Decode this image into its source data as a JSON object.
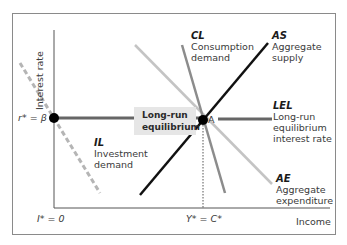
{
  "axes": {
    "y_label": "Interest rate",
    "x_label": "Income",
    "y_tick": "r* = β",
    "x_tick_left": "I* = 0",
    "x_tick_eq": "Y* = C*"
  },
  "points": {
    "beta": "β",
    "A": "A"
  },
  "callout": {
    "line1": "Long-run",
    "line2": "equilibrium"
  },
  "curves": [
    {
      "abbr": "CL",
      "line1": "Consumption",
      "line2": "demand",
      "line3": "",
      "color": "#8c8c8c",
      "style": "solid"
    },
    {
      "abbr": "AS",
      "line1": "Aggregate",
      "line2": "supply",
      "line3": "",
      "color": "#111111",
      "style": "solid"
    },
    {
      "abbr": "LEL",
      "line1": "Long-run",
      "line2": "equilibrium",
      "line3": "interest rate",
      "color": "#666666",
      "style": "solid"
    },
    {
      "abbr": "IL",
      "line1": "Investment",
      "line2": "demand",
      "line3": "",
      "color": "#b5b5b5",
      "style": "dashed"
    },
    {
      "abbr": "AE",
      "line1": "Aggregate",
      "line2": "expenditure",
      "line3": "",
      "color": "#c4c4c4",
      "style": "solid"
    }
  ]
}
